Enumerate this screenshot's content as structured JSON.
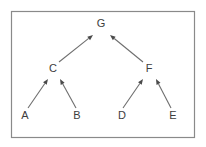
{
  "figure": {
    "kind": "directed-acyclic-graph",
    "title": "",
    "frame": {
      "x": 11,
      "y": 11,
      "width": 184,
      "height": 127,
      "border_color": "#8a8a8a",
      "background_color": "#ffffff"
    },
    "style": {
      "node_label_color": "#3d3d3d",
      "edge_color": "#6e6e6e",
      "arrow_color": "#4a4a4a",
      "node_font_size": "11px"
    }
  },
  "nodes": [
    {
      "id": "G",
      "label": "G",
      "x": 101,
      "y": 24,
      "level": 0
    },
    {
      "id": "C",
      "label": "C",
      "x": 53,
      "y": 69,
      "level": 1
    },
    {
      "id": "F",
      "label": "F",
      "x": 149,
      "y": 69,
      "level": 1
    },
    {
      "id": "A",
      "label": "A",
      "x": 25,
      "y": 116,
      "level": 2
    },
    {
      "id": "B",
      "label": "B",
      "x": 77,
      "y": 116,
      "level": 2
    },
    {
      "id": "D",
      "label": "D",
      "x": 122,
      "y": 116,
      "level": 2
    },
    {
      "id": "E",
      "label": "E",
      "x": 173,
      "y": 116,
      "level": 2
    }
  ],
  "edges": [
    {
      "id": "edge-c-g",
      "from": "C",
      "to": "G",
      "x1": 59,
      "y1": 62,
      "x2": 93,
      "y2": 35,
      "arrow": true
    },
    {
      "id": "edge-f-g",
      "from": "F",
      "to": "G",
      "x1": 143,
      "y1": 62,
      "x2": 110,
      "y2": 35,
      "arrow": true
    },
    {
      "id": "edge-a-c",
      "from": "A",
      "to": "C",
      "x1": 28,
      "y1": 108,
      "x2": 48,
      "y2": 79,
      "arrow": true
    },
    {
      "id": "edge-b-c",
      "from": "B",
      "to": "C",
      "x1": 76,
      "y1": 108,
      "x2": 60,
      "y2": 79,
      "arrow": true
    },
    {
      "id": "edge-d-f",
      "from": "D",
      "to": "F",
      "x1": 123,
      "y1": 108,
      "x2": 143,
      "y2": 79,
      "arrow": true
    },
    {
      "id": "edge-e-f",
      "from": "E",
      "to": "F",
      "x1": 171,
      "y1": 108,
      "x2": 156,
      "y2": 79,
      "arrow": true
    }
  ]
}
